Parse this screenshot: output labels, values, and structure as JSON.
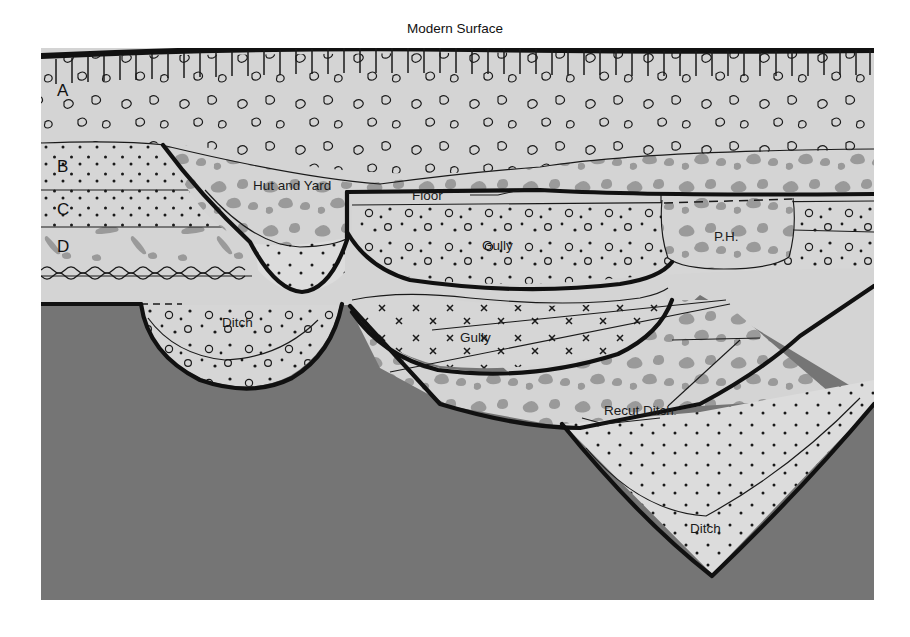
{
  "figure": {
    "kind": "archaeological-section-drawing",
    "title": "Modern Surface",
    "frame": {
      "x": 41,
      "y": 48,
      "width": 833,
      "height": 552
    }
  },
  "colors": {
    "page_background": "#ffffff",
    "deposit_light": "#d4d4d4",
    "deposit_pale": "#dcdcdc",
    "bedrock_dark": "#757575",
    "gravel_blob": "#9a9a9a",
    "ink": "#111111"
  },
  "labels": {
    "modern_surface": "Modern Surface",
    "strata": [
      "A",
      "B",
      "C",
      "D"
    ],
    "hut_and_yard": "Hut and Yard",
    "floor": "Floor",
    "post_hole": "P.H.",
    "gully_upper": "Gully",
    "gully_lower": "Gully",
    "ditch_left": "Ditch",
    "recut_ditch": "Recut Ditch",
    "ditch_right": "Ditch"
  },
  "strata_layers": [
    {
      "id": "A",
      "label": "A",
      "fill": "deposit_light",
      "texture": "open-pebbles",
      "label_x": 57,
      "label_y": 96
    },
    {
      "id": "B",
      "label": "B",
      "fill": "deposit_light",
      "texture": "fine-dots",
      "label_x": 57,
      "label_y": 166
    },
    {
      "id": "C",
      "label": "C",
      "fill": "deposit_light",
      "texture": "fine-dots",
      "label_x": 57,
      "label_y": 210
    },
    {
      "id": "D",
      "label": "D",
      "fill": "deposit_light",
      "texture": "sparse-flakes",
      "label_x": 57,
      "label_y": 246
    }
  ],
  "features": [
    {
      "name": "hut-and-yard",
      "label": "Hut and Yard",
      "label_x": 253,
      "label_y": 186,
      "texture": "gravel-blobs"
    },
    {
      "name": "floor",
      "label": "Floor",
      "label_x": 435,
      "label_y": 199,
      "leader": "from label to thick floor line"
    },
    {
      "name": "post-hole",
      "label": "P.H.",
      "label_x": 727,
      "label_y": 236,
      "texture": "gravel-blobs"
    },
    {
      "name": "gully-upper",
      "label": "Gully",
      "label_x": 498,
      "label_y": 246,
      "texture": "rings-and-dots"
    },
    {
      "name": "gully-lower",
      "label": "Gully",
      "label_x": 480,
      "label_y": 337,
      "texture": "x-marks"
    },
    {
      "name": "ditch-left",
      "label": "Ditch",
      "label_x": 237,
      "label_y": 323,
      "texture": "rings-and-dots"
    },
    {
      "name": "recut-ditch",
      "label": "Recut Ditch",
      "label_x": 612,
      "label_y": 413,
      "texture": "gravel-blobs"
    },
    {
      "name": "ditch-right",
      "label": "Ditch",
      "label_x": 708,
      "label_y": 530,
      "texture": "fine-dots"
    }
  ],
  "surface": {
    "hachure_count": 53,
    "note": "turf-line hachures below thick modern ground surface"
  }
}
